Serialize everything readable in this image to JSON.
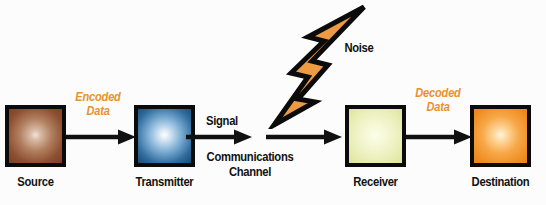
{
  "diagram": {
    "background_color": "#fcfcfc",
    "nodes": [
      {
        "id": "source",
        "label": "Source",
        "color": "#8d4f31",
        "icon": "glowing-square-brown"
      },
      {
        "id": "transmitter",
        "label": "Transmitter",
        "color": "#2f6c9e",
        "icon": "glowing-square-blue"
      },
      {
        "id": "receiver",
        "label": "Receiver",
        "color": "#ecf0bd",
        "icon": "glowing-square-yellow-green"
      },
      {
        "id": "destination",
        "label": "Destination",
        "color": "#f7a848",
        "icon": "glowing-square-orange"
      }
    ],
    "flow_labels": {
      "encoded_data_line1": "Encoded",
      "encoded_data_line2": "Data",
      "decoded_data_line1": "Decoded",
      "decoded_data_line2": "Data",
      "signal": "Signal",
      "channel_line1": "Communications",
      "channel_line2": "Channel",
      "noise": "Noise"
    },
    "accent_color": "#e8922c",
    "line_color": "#121212",
    "noise_icon": "lightning-bolt-icon",
    "arrows": [
      {
        "id": "source-to-transmitter",
        "from": "source",
        "to": "transmitter"
      },
      {
        "id": "transmitter-to-channel",
        "from": "transmitter",
        "to": "channel"
      },
      {
        "id": "channel-to-receiver",
        "from": "channel",
        "to": "receiver"
      },
      {
        "id": "receiver-to-destination",
        "from": "receiver",
        "to": "destination"
      }
    ]
  }
}
